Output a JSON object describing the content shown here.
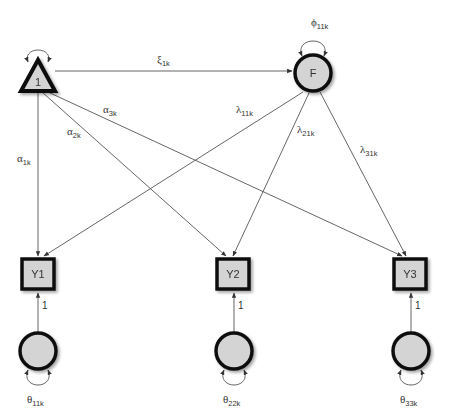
{
  "diagram": {
    "type": "structural-equation-path-diagram",
    "nodes": {
      "constant": {
        "label": "1",
        "shape": "triangle"
      },
      "factor": {
        "label": "F",
        "shape": "circle"
      },
      "y1": {
        "label": "Y1",
        "shape": "square"
      },
      "y2": {
        "label": "Y2",
        "shape": "square"
      },
      "y3": {
        "label": "Y3",
        "shape": "square"
      },
      "e1": {
        "label": "",
        "shape": "circle"
      },
      "e2": {
        "label": "",
        "shape": "circle"
      },
      "e3": {
        "label": "",
        "shape": "circle"
      }
    },
    "paths": {
      "xi": {
        "sym": "ξ",
        "sub": "1k"
      },
      "phi": {
        "sym": "ϕ",
        "sub": "11k"
      },
      "alpha1": {
        "sym": "α",
        "sub": "1k"
      },
      "alpha2": {
        "sym": "α",
        "sub": "2k"
      },
      "alpha3": {
        "sym": "α",
        "sub": "3k"
      },
      "lambda1": {
        "sym": "λ",
        "sub": "11k"
      },
      "lambda2": {
        "sym": "λ",
        "sub": "21k"
      },
      "lambda3": {
        "sym": "λ",
        "sub": "31k"
      },
      "theta1": {
        "sym": "θ",
        "sub": "11k"
      },
      "theta2": {
        "sym": "θ",
        "sub": "22k"
      },
      "theta3": {
        "sym": "θ",
        "sub": "33k"
      },
      "error_loading_1": "1",
      "error_loading_2": "1",
      "error_loading_3": "1"
    },
    "colors": {
      "node_fill": "#d4d4d4",
      "node_stroke": "#111111",
      "edge": "#555555",
      "text": "#333333"
    }
  }
}
